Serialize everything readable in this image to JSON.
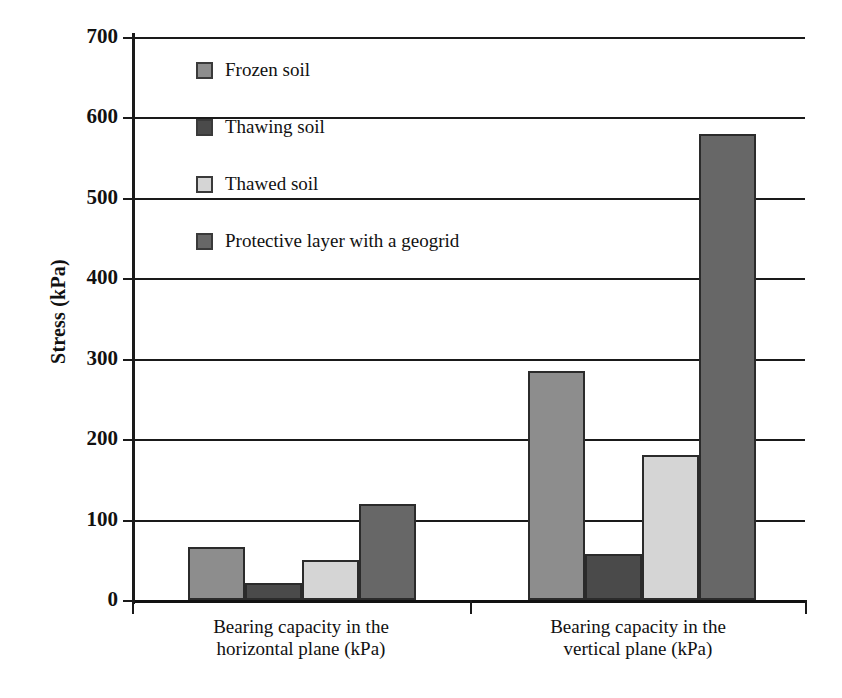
{
  "chart_data": {
    "type": "bar",
    "title": "",
    "xlabel": "",
    "ylabel": "Stress (kPa)",
    "ylim": [
      0,
      700
    ],
    "ytick_step": 100,
    "yticks": [
      "700",
      "600",
      "500",
      "400",
      "300",
      "200",
      "100",
      "0"
    ],
    "grid": true,
    "legend_position": "upper-left-inside",
    "categories": [
      "Bearing capacity in the horizontal plane (kPa)",
      "Bearing capacity in the vertical plane (kPa)"
    ],
    "category_lines": [
      [
        "Bearing capacity in the",
        "horizontal plane (kPa)"
      ],
      [
        "Bearing capacity in the",
        "vertical plane (kPa)"
      ]
    ],
    "series": [
      {
        "name": "Frozen soil",
        "color": "#8d8d8d",
        "values": [
          66,
          285
        ]
      },
      {
        "name": "Thawing soil",
        "color": "#4a4a4a",
        "values": [
          21,
          57
        ]
      },
      {
        "name": "Thawed soil",
        "color": "#d5d5d5",
        "values": [
          50,
          180
        ]
      },
      {
        "name": "Protective layer with a geogrid",
        "color": "#676767",
        "values": [
          119,
          580
        ]
      }
    ]
  },
  "legend": {
    "items": [
      {
        "label": "Frozen soil",
        "color": "#8d8d8d"
      },
      {
        "label": "Thawing soil",
        "color": "#4a4a4a"
      },
      {
        "label": "Thawed soil",
        "color": "#d5d5d5"
      },
      {
        "label": "Protective layer with a geogrid",
        "color": "#676767"
      }
    ]
  },
  "axis": {
    "y_title": "Stress (kPa)"
  },
  "colors": {
    "axis": "#1a1a1a",
    "text": "#111111",
    "background": "#ffffff"
  }
}
